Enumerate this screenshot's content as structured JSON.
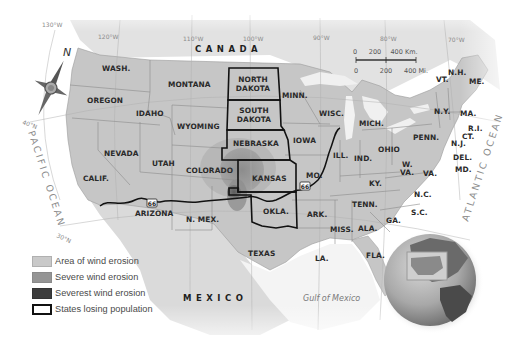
{
  "map": {
    "title": "Dust Bowl wind erosion and population loss",
    "countries": {
      "canada": "CANADA",
      "mexico": "MEXICO"
    },
    "water_bodies": {
      "pacific": "PACIFIC OCEAN",
      "atlantic": "ATLANTIC OCEAN",
      "gulf": "Gulf of Mexico"
    },
    "longitudes": [
      "130°W",
      "120°W",
      "110°W",
      "100°W",
      "90°W",
      "80°W",
      "70°W"
    ],
    "latitudes": [
      "40°N",
      "30°N"
    ],
    "route": {
      "name": "66"
    },
    "compass": {
      "label": "N"
    },
    "scale": {
      "km_ticks": [
        "0",
        "200",
        "400 Km."
      ],
      "mi_ticks": [
        "0",
        "200",
        "400 Mi."
      ]
    },
    "states": {
      "wash": "WASH.",
      "oregon": "OREGON",
      "idaho": "IDAHO",
      "montana": "MONTANA",
      "wyoming": "WYOMING",
      "nevada": "NEVADA",
      "utah": "UTAH",
      "colorado": "COLORADO",
      "calif": "CALIF.",
      "arizona": "ARIZONA",
      "nmex": "N. MEX.",
      "ndak1": "NORTH",
      "ndak2": "DAKOTA",
      "sdak1": "SOUTH",
      "sdak2": "DAKOTA",
      "nebraska": "NEBRASKA",
      "kansas": "KANSAS",
      "okla": "OKLA.",
      "texas": "TEXAS",
      "minn": "MINN.",
      "iowa": "IOWA",
      "mo": "MO.",
      "ark": "ARK.",
      "la": "LA.",
      "wisc": "WISC.",
      "ill": "ILL.",
      "mich": "MICH.",
      "ind": "IND.",
      "ohio": "OHIO",
      "ky": "KY.",
      "tenn": "TENN.",
      "miss": "MISS.",
      "ala": "ALA.",
      "ga": "GA.",
      "fla": "FLA.",
      "sc": "S.C.",
      "nc": "N.C.",
      "va": "VA.",
      "wva1": "W.",
      "wva2": "VA.",
      "md": "MD.",
      "del": "DEL.",
      "nj": "N.J.",
      "penn": "PENN.",
      "ny": "N.Y.",
      "ct": "CT.",
      "ri": "R.I.",
      "ma": "MA.",
      "vt": "VT.",
      "nh": "N.H.",
      "me": "ME."
    }
  },
  "legend": {
    "items": [
      {
        "label": "Area of wind erosion",
        "color": "#c9c9c9",
        "border": "#b0b0b0"
      },
      {
        "label": "Severe wind erosion",
        "color": "#959595",
        "border": "#8a8a8a"
      },
      {
        "label": "Severest wind erosion",
        "color": "#3c3c3c",
        "border": "#333333"
      },
      {
        "label": "States losing population",
        "color": "#ffffff",
        "border": "#111111"
      }
    ]
  },
  "colors": {
    "land": "#c4c4c4",
    "land_light": "#d6d6d6",
    "water": "#f2f2f2",
    "erosion": "#b3b3b3",
    "severe": "#8f8f8f",
    "severest": "#555555",
    "outline": "#111111"
  }
}
